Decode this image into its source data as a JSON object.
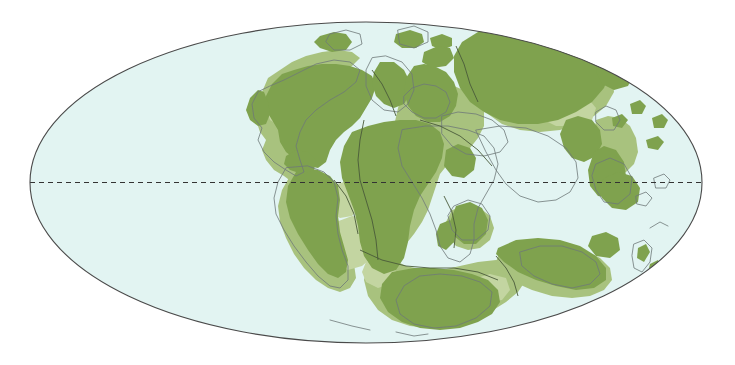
{
  "figure": {
    "kind": "paleogeographic-world-map",
    "projection": "mollweide-ellipse",
    "title": "",
    "caption": "",
    "width": 735,
    "height": 365
  },
  "colors": {
    "background": "#ffffff",
    "ocean": "#e2f4f2",
    "land": "#7fa24e",
    "shelf": "#a8c27e",
    "shelf_pale": "#c3d5a1",
    "coastline_modern": "#6f7878",
    "plate_outline": "#4a5a3a",
    "frame": "#4a4a4a",
    "equator": "#333333"
  },
  "geometry": {
    "ellipse": {
      "cx": 366,
      "cy": 182.5,
      "rx": 336,
      "ry": 160.5
    },
    "equator": {
      "y": 182.5,
      "dash": "5 4",
      "label": "equator"
    }
  },
  "layers": [
    {
      "name": "ocean",
      "label": "Ocean / open sea",
      "color": "#e2f4f2"
    },
    {
      "name": "shelf",
      "label": "Continental shelf / shallow sea",
      "color": "#a8c27e"
    },
    {
      "name": "land",
      "label": "Emergent land",
      "color": "#7fa24e"
    },
    {
      "name": "modern-coastlines",
      "label": "Present-day coastline reference",
      "color": "#6f7878"
    },
    {
      "name": "equator",
      "label": "Equator",
      "color": "#333333"
    }
  ],
  "landmasses": [
    {
      "id": "laurentia",
      "label": "North America / Laurentia"
    },
    {
      "id": "greenland",
      "label": "Greenland"
    },
    {
      "id": "eurasia",
      "label": "Europe / Baltica"
    },
    {
      "id": "siberia",
      "label": "Siberia / Angara"
    },
    {
      "id": "china-blocks",
      "label": "North & South China blocks"
    },
    {
      "id": "southeast-asia",
      "label": "Southeast Asian terranes"
    },
    {
      "id": "south-america",
      "label": "South America"
    },
    {
      "id": "africa",
      "label": "Africa"
    },
    {
      "id": "arabia",
      "label": "Arabia"
    },
    {
      "id": "india",
      "label": "India"
    },
    {
      "id": "madagascar",
      "label": "Madagascar"
    },
    {
      "id": "antarctica",
      "label": "Antarctica"
    },
    {
      "id": "australia",
      "label": "Australia"
    },
    {
      "id": "new-zealand",
      "label": "New Zealand"
    }
  ]
}
